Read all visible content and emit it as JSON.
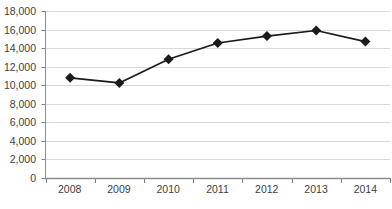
{
  "chart_data": {
    "type": "line",
    "title": "",
    "subtitle": "",
    "xlabel": "",
    "ylabel": "",
    "categories": [
      "2008",
      "2009",
      "2010",
      "2011",
      "2012",
      "2013",
      "2014"
    ],
    "values": [
      10800,
      10250,
      12800,
      14550,
      15300,
      15900,
      14700
    ],
    "series": [
      {
        "name": "",
        "values": [
          10800,
          10250,
          12800,
          14550,
          15300,
          15900,
          14700
        ]
      }
    ],
    "ylim": [
      0,
      18000
    ],
    "ytick_values": [
      0,
      2000,
      4000,
      6000,
      8000,
      10000,
      12000,
      14000,
      16000,
      18000
    ],
    "ytick_labels": [
      "0",
      "2,000",
      "4,000",
      "6,000",
      "8,000",
      "10,000",
      "12,000",
      "14,000",
      "16,000",
      "18,000"
    ],
    "grid": true,
    "grid_axis": "y",
    "legend": false,
    "legend_position": "none",
    "marker": "diamond",
    "annotations": []
  },
  "style": {
    "line_color": "#1a1a1a",
    "marker_color": "#1a1a1a",
    "grid_color": "#d9d9d9",
    "axis_color": "#808080",
    "tick_label_color": "#404040",
    "background": "#ffffff"
  },
  "footer": {
    "caption": ""
  }
}
